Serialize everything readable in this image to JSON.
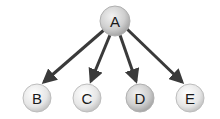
{
  "diagram": {
    "type": "tree",
    "root": {
      "id": "A",
      "label": "A",
      "cx": 115,
      "cy": 21,
      "r": 15,
      "shade": "dark"
    },
    "children": [
      {
        "id": "B",
        "label": "B",
        "cx": 37,
        "cy": 98,
        "r": 14,
        "shade": "light"
      },
      {
        "id": "C",
        "label": "C",
        "cx": 87,
        "cy": 98,
        "r": 14,
        "shade": "light"
      },
      {
        "id": "D",
        "label": "D",
        "cx": 140,
        "cy": 98,
        "r": 14,
        "shade": "dark"
      },
      {
        "id": "E",
        "label": "E",
        "cx": 190,
        "cy": 98,
        "r": 14,
        "shade": "light"
      }
    ],
    "edges": [
      {
        "from": "A",
        "to": "B"
      },
      {
        "from": "A",
        "to": "C"
      },
      {
        "from": "A",
        "to": "D"
      },
      {
        "from": "A",
        "to": "E"
      }
    ],
    "colors": {
      "edge": "#3a3a3a",
      "node_light_center": "#ffffff",
      "node_light_edge": "#c8c8c8",
      "node_dark_center": "#eeeeee",
      "node_dark_edge": "#a8a8a8",
      "node_stroke": "#b0b0b0",
      "label": "#1a1a1a"
    }
  }
}
